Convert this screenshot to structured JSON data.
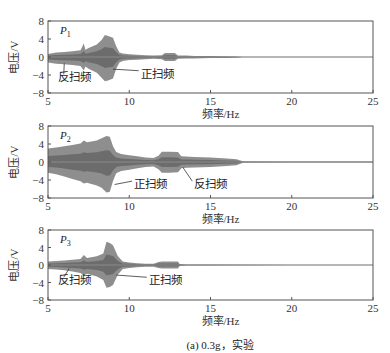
{
  "chart_data": [
    {
      "type": "area",
      "panel": "P1",
      "panel_label": "P",
      "panel_subscript": "1",
      "xlabel": "频率/Hz",
      "ylabel": "电压/V",
      "xlim": [
        5,
        25
      ],
      "ylim": [
        -8,
        8
      ],
      "xticks": [
        5,
        10,
        15,
        20,
        25
      ],
      "yticks": [
        8,
        4,
        0,
        -4,
        -8
      ],
      "grid": false,
      "description": "Voltage envelope vs sweep frequency; forward and reverse sweep overlaid",
      "envelope": {
        "x": [
          5.0,
          5.5,
          6.0,
          6.5,
          7.0,
          7.2,
          7.3,
          7.5,
          8.0,
          8.3,
          8.5,
          8.7,
          9.0,
          9.2,
          9.4,
          9.6,
          10.0,
          10.5,
          11.0,
          11.5,
          12.0,
          12.2,
          12.8,
          13.0,
          13.5,
          14.0,
          15.0,
          16.0,
          16.6,
          17.0,
          20.0,
          25.0
        ],
        "upper": [
          0.7,
          1.0,
          1.1,
          1.3,
          1.5,
          3.0,
          1.6,
          2.0,
          2.8,
          3.8,
          4.9,
          4.7,
          4.3,
          2.4,
          1.0,
          0.8,
          0.6,
          0.5,
          0.4,
          0.3,
          0.4,
          0.9,
          0.9,
          0.3,
          0.3,
          0.25,
          0.2,
          0.15,
          0.12,
          0.05,
          0.05,
          0.05
        ],
        "lower": [
          -1.2,
          -1.5,
          -1.6,
          -1.8,
          -2.0,
          -3.0,
          -2.1,
          -2.6,
          -3.5,
          -4.6,
          -5.4,
          -5.2,
          -4.8,
          -2.6,
          -1.2,
          -0.9,
          -0.7,
          -0.6,
          -0.5,
          -0.4,
          -0.5,
          -0.9,
          -0.9,
          -0.4,
          -0.35,
          -0.3,
          -0.25,
          -0.2,
          -0.15,
          -0.05,
          -0.05,
          -0.05
        ]
      },
      "annotations": [
        {
          "text": "反扫频",
          "label_x": 5.6,
          "label_y": -5.4,
          "arrow_to": [
            6.0,
            -1.4
          ]
        },
        {
          "text": "正扫频",
          "label_x": 10.7,
          "label_y": -4.6,
          "arrow_to": [
            9.0,
            -2.7
          ]
        }
      ]
    },
    {
      "type": "area",
      "panel": "P2",
      "panel_label": "P",
      "panel_subscript": "2",
      "xlabel": "频率/Hz",
      "ylabel": "电压/V",
      "xlim": [
        5,
        25
      ],
      "ylim": [
        -8,
        8
      ],
      "xticks": [
        5,
        10,
        15,
        20,
        25
      ],
      "yticks": [
        8,
        4,
        0,
        -4,
        -8
      ],
      "grid": false,
      "description": "Voltage envelope vs sweep frequency; forward and reverse sweep overlaid",
      "envelope": {
        "x": [
          5.0,
          5.5,
          6.0,
          6.5,
          7.0,
          7.2,
          7.4,
          8.0,
          8.3,
          8.6,
          8.8,
          9.0,
          9.2,
          9.5,
          10.0,
          10.5,
          11.0,
          11.5,
          11.8,
          12.0,
          12.5,
          13.0,
          13.2,
          13.5,
          14.0,
          15.0,
          16.0,
          16.6,
          17.0,
          20.0,
          25.0
        ],
        "upper": [
          3.0,
          3.2,
          3.5,
          3.8,
          4.1,
          4.8,
          4.4,
          4.8,
          5.3,
          5.8,
          5.6,
          3.5,
          2.2,
          1.8,
          1.5,
          1.3,
          1.0,
          0.9,
          1.4,
          2.3,
          2.3,
          2.2,
          1.3,
          1.2,
          1.1,
          1.0,
          0.8,
          0.6,
          0.15,
          0.1,
          0.1
        ],
        "lower": [
          -2.4,
          -2.7,
          -3.2,
          -3.8,
          -4.3,
          -4.8,
          -4.6,
          -5.2,
          -5.7,
          -6.8,
          -6.6,
          -4.2,
          -2.5,
          -2.0,
          -1.7,
          -1.4,
          -1.1,
          -1.0,
          -1.6,
          -2.4,
          -2.4,
          -2.3,
          -1.4,
          -1.3,
          -1.2,
          -1.1,
          -0.9,
          -0.7,
          -0.15,
          -0.1,
          -0.1
        ]
      },
      "annotations": [
        {
          "text": "正扫频",
          "label_x": 10.3,
          "label_y": -5.8,
          "arrow_to": [
            9.1,
            -5.0
          ]
        },
        {
          "text": "反扫频",
          "label_x": 14.0,
          "label_y": -5.8,
          "arrow_to": [
            13.3,
            -1.2
          ]
        }
      ]
    },
    {
      "type": "area",
      "panel": "P3",
      "panel_label": "P",
      "panel_subscript": "3",
      "xlabel": "频率/Hz",
      "ylabel": "电压/V",
      "xlim": [
        5,
        25
      ],
      "ylim": [
        -8,
        8
      ],
      "xticks": [
        5,
        10,
        15,
        20,
        25
      ],
      "yticks": [
        8,
        4,
        0,
        -4,
        -8
      ],
      "grid": false,
      "description": "Voltage envelope vs sweep frequency; forward and reverse sweep overlaid",
      "envelope": {
        "x": [
          5.0,
          5.5,
          6.0,
          6.5,
          7.0,
          7.2,
          7.4,
          8.0,
          8.4,
          8.6,
          8.8,
          9.0,
          9.3,
          9.6,
          10.0,
          10.5,
          11.0,
          11.5,
          11.8,
          12.0,
          12.5,
          13.0,
          13.1,
          13.5,
          15.0,
          20.0,
          25.0
        ],
        "upper": [
          0.8,
          0.9,
          1.0,
          1.2,
          1.4,
          2.3,
          1.6,
          2.0,
          2.6,
          5.3,
          5.0,
          4.5,
          2.0,
          0.8,
          0.6,
          0.4,
          0.3,
          0.3,
          0.7,
          0.8,
          0.8,
          0.8,
          0.2,
          0.1,
          0.08,
          0.06,
          0.05
        ],
        "lower": [
          -0.9,
          -1.0,
          -1.2,
          -1.5,
          -1.8,
          -2.4,
          -2.0,
          -2.6,
          -3.4,
          -5.2,
          -5.0,
          -4.6,
          -2.2,
          -0.9,
          -0.7,
          -0.5,
          -0.4,
          -0.4,
          -0.7,
          -0.8,
          -0.8,
          -0.8,
          -0.2,
          -0.1,
          -0.08,
          -0.06,
          -0.05
        ]
      },
      "annotations": [
        {
          "text": "反扫频",
          "label_x": 5.6,
          "label_y": -4.4,
          "arrow_to": [
            6.3,
            -0.8
          ]
        },
        {
          "text": "正扫频",
          "label_x": 11.2,
          "label_y": -4.4,
          "arrow_to": [
            9.2,
            -2.3
          ]
        }
      ]
    }
  ],
  "caption": "(a) 0.3g，实验",
  "colors": {
    "signal": "#7a7a7a",
    "signal_dark": "#5e5e5e",
    "axis": "#555555",
    "zero_line": "#8a8a8a",
    "text": "#222222"
  }
}
